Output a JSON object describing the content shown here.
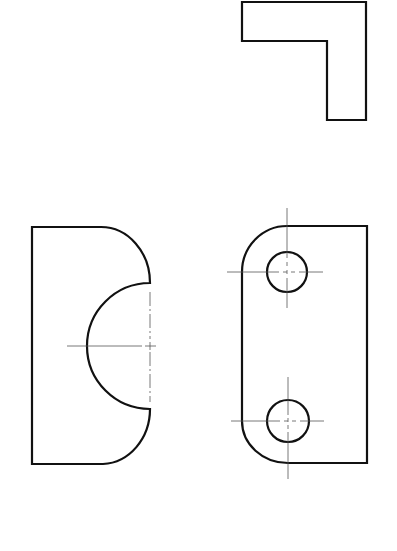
{
  "drawing": {
    "type": "orthographic technical drawing",
    "colors": {
      "background": "#ffffff",
      "outline": "#111111",
      "centerline": "#555555"
    },
    "views": [
      {
        "name": "top-view",
        "shape": "L-shaped profile"
      },
      {
        "name": "left-view",
        "shape": "rectangle with rounded right corners and semicircular notch"
      },
      {
        "name": "front-view",
        "shape": "plate with rounded left corners and two holes"
      }
    ]
  }
}
